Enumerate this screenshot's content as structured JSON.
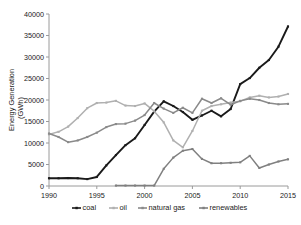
{
  "chart_data": {
    "type": "line",
    "title": "",
    "xlabel": "",
    "ylabel": "Energy Generation",
    "ylabel_units": "(GWh)",
    "xlim": [
      1990,
      2015
    ],
    "ylim": [
      0,
      40000
    ],
    "grid": false,
    "legend_position": "bottom",
    "x": [
      1990,
      1991,
      1992,
      1993,
      1994,
      1995,
      1996,
      1997,
      1998,
      1999,
      2000,
      2001,
      2002,
      2003,
      2004,
      2005,
      2006,
      2007,
      2008,
      2009,
      2010,
      2011,
      2012,
      2013,
      2014,
      2015
    ],
    "xticks": [
      "1990",
      "1995",
      "2000",
      "2005",
      "2010",
      "2015"
    ],
    "yticks": [
      "0",
      "5000",
      "10000",
      "15000",
      "20000",
      "25000",
      "30000",
      "35000",
      "40000"
    ],
    "series": [
      {
        "name": "coal",
        "color": "#1a1a1a",
        "marker": "square",
        "values": [
          1800,
          1800,
          1850,
          1800,
          1600,
          2100,
          4800,
          7200,
          9500,
          11100,
          14200,
          17300,
          19700,
          18600,
          17200,
          15400,
          16400,
          17500,
          16200,
          17900,
          23700,
          25100,
          27500,
          29300,
          32400,
          37100
        ]
      },
      {
        "name": "oil",
        "color": "#b0b0b0",
        "marker": "square",
        "values": [
          12000,
          12600,
          13800,
          15800,
          18100,
          19300,
          19400,
          19800,
          18700,
          18600,
          19200,
          17400,
          14800,
          10600,
          9000,
          12800,
          17500,
          18600,
          19000,
          19400,
          19700,
          20600,
          21000,
          20600,
          20800,
          21400
        ]
      },
      {
        "name": "natural gas",
        "color": "#8a8a8a",
        "marker": "square",
        "values": [
          12200,
          11400,
          10200,
          10600,
          11400,
          12400,
          13700,
          14400,
          14500,
          15200,
          16500,
          19300,
          18000,
          17000,
          18200,
          17000,
          20300,
          19300,
          20400,
          18900,
          19800,
          20300,
          20000,
          19300,
          19000,
          19100
        ]
      },
      {
        "name": "renewables",
        "color": "#808080",
        "marker": "square",
        "values": [
          null,
          null,
          null,
          null,
          null,
          null,
          null,
          100,
          100,
          100,
          100,
          100,
          4000,
          6600,
          8200,
          8600,
          6300,
          5300,
          5300,
          5400,
          5500,
          7000,
          4200,
          5000,
          5700,
          6200
        ]
      }
    ]
  },
  "legend": {
    "items": [
      {
        "label": "coal"
      },
      {
        "label": "oil"
      },
      {
        "label": "natural gas"
      },
      {
        "label": "renewables"
      }
    ]
  }
}
